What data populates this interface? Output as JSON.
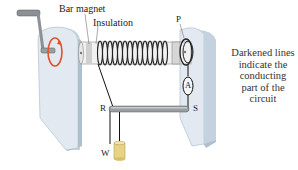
{
  "diagram": {
    "type": "apparatus-illustration",
    "labels": {
      "bar_magnet": "Bar magnet",
      "insulation": "Insulation",
      "P": "P",
      "A": "A",
      "R": "R",
      "S": "S",
      "W": "W"
    },
    "caption_lines": [
      "Darkened lines",
      "indicate the",
      "conducting",
      "part of the",
      "circuit"
    ],
    "colors": {
      "stand": "#dde6ee",
      "stand_shadow": "#b9c8d6",
      "rotation_arrow": "#e0522a",
      "rod": "#9a9ea3",
      "weight": "#e8d189",
      "wire": "#111111"
    }
  }
}
